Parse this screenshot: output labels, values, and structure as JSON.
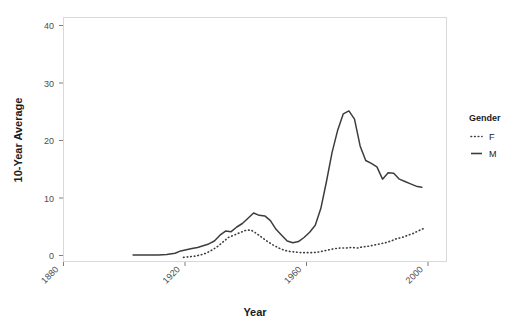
{
  "chart_data": {
    "type": "line",
    "title": "",
    "xlabel": "Year",
    "ylabel": "10-Year Average",
    "xlim": [
      1870,
      2007
    ],
    "ylim": [
      0,
      42
    ],
    "xticks": [
      1880,
      1920,
      1960,
      2000
    ],
    "xtick_labels": [
      "1880",
      "1920",
      "1960",
      "2000"
    ],
    "yticks": [
      0,
      10,
      20,
      30,
      40
    ],
    "ytick_labels": [
      "0",
      "10",
      "20",
      "30",
      "40"
    ],
    "grid": false,
    "legend": {
      "title": "Gender",
      "position": "right",
      "entries": [
        {
          "label": "F",
          "style": "dotted"
        },
        {
          "label": "M",
          "style": "solid"
        }
      ]
    },
    "series": [
      {
        "name": "M",
        "label": "M",
        "style": "solid",
        "color": "#3d3d3d",
        "x": [
          1895,
          1898,
          1901,
          1904,
          1907,
          1910,
          1912,
          1914,
          1916,
          1918,
          1920,
          1922,
          1924,
          1926,
          1928,
          1930,
          1932,
          1934,
          1936,
          1938,
          1940,
          1942,
          1944,
          1946,
          1948,
          1950,
          1952,
          1954,
          1956,
          1958,
          1960,
          1962,
          1964,
          1966,
          1968,
          1970,
          1972,
          1974,
          1976,
          1978,
          1980,
          1982,
          1984,
          1986,
          1988,
          1990,
          1992,
          1994,
          1996,
          1998
        ],
        "values": [
          1.2,
          1.2,
          1.2,
          1.2,
          1.3,
          1.5,
          1.9,
          2.1,
          2.3,
          2.5,
          2.8,
          3.1,
          3.6,
          4.6,
          5.3,
          5.2,
          6.0,
          6.6,
          7.5,
          8.4,
          8.0,
          7.9,
          7.1,
          5.6,
          4.6,
          3.6,
          3.3,
          3.5,
          4.2,
          5.1,
          6.3,
          9.2,
          13.8,
          18.8,
          22.6,
          25.4,
          25.9,
          24.5,
          19.9,
          17.4,
          16.9,
          16.3,
          14.2,
          15.3,
          15.2,
          14.2,
          13.8,
          13.4,
          13.0,
          12.8
        ]
      },
      {
        "name": "F",
        "label": "F",
        "style": "dotted",
        "color": "#3d3d3d",
        "x": [
          1913,
          1915,
          1917,
          1919,
          1921,
          1923,
          1925,
          1927,
          1929,
          1931,
          1933,
          1935,
          1937,
          1939,
          1941,
          1943,
          1945,
          1947,
          1949,
          1951,
          1953,
          1955,
          1957,
          1959,
          1961,
          1963,
          1965,
          1967,
          1969,
          1971,
          1973,
          1975,
          1977,
          1979,
          1981,
          1983,
          1985,
          1987,
          1989,
          1991,
          1993,
          1995,
          1997,
          1999
        ],
        "values": [
          0.8,
          0.9,
          1.0,
          1.2,
          1.5,
          2.0,
          2.6,
          3.4,
          4.2,
          4.6,
          5.0,
          5.4,
          5.5,
          4.9,
          4.2,
          3.5,
          2.9,
          2.4,
          2.0,
          1.8,
          1.7,
          1.6,
          1.6,
          1.6,
          1.7,
          1.9,
          2.1,
          2.3,
          2.4,
          2.4,
          2.5,
          2.4,
          2.6,
          2.7,
          2.9,
          3.1,
          3.3,
          3.6,
          4.0,
          4.2,
          4.6,
          4.9,
          5.4,
          5.8
        ]
      }
    ]
  }
}
